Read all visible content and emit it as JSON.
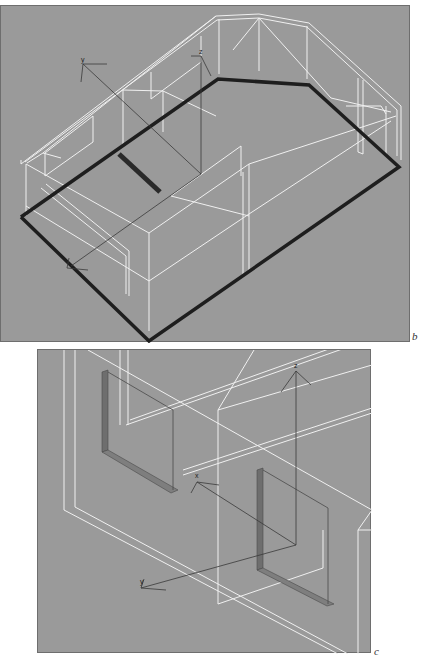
{
  "figure": {
    "panels": [
      {
        "id": "b",
        "caption": "b",
        "view": "3D wireframe perspective of a house with highlighted floor outline",
        "axis_labels": {
          "y": "y",
          "z": "z"
        }
      },
      {
        "id": "c",
        "caption": "c",
        "view": "3D wireframe close-up of wall pieces with local axes",
        "axis_labels": {
          "z": "z",
          "x": "x",
          "y": "y"
        }
      }
    ],
    "colors": {
      "background": "#9a9a9a",
      "wireframe": "#f2f2f2",
      "outline": "#1e1e1e",
      "axes": "#3a3a3a",
      "wall_piece": "#6e6e6e"
    }
  }
}
